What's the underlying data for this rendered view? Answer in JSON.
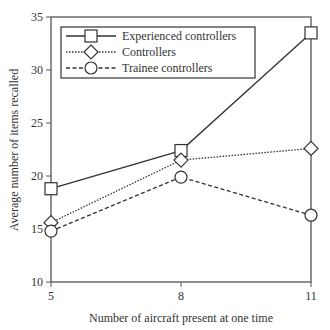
{
  "chart_data": {
    "type": "line",
    "title": "",
    "xlabel": "Number of aircraft present at one time",
    "ylabel": "Average number of items recalled",
    "x": [
      5,
      8,
      11
    ],
    "x_tick_labels": [
      "5",
      "8",
      "11"
    ],
    "y_ticks": [
      10,
      15,
      20,
      25,
      30,
      35
    ],
    "y_tick_labels": [
      "10",
      "15",
      "20",
      "25",
      "30",
      "35"
    ],
    "xlim": [
      5,
      11
    ],
    "ylim": [
      10,
      35
    ],
    "grid": false,
    "legend_position": "upper left",
    "series": [
      {
        "name": "Experienced controllers",
        "values": [
          18.8,
          22.4,
          33.5
        ],
        "marker": "square",
        "line_style": "solid"
      },
      {
        "name": "Controllers",
        "values": [
          15.6,
          21.5,
          22.6
        ],
        "marker": "diamond",
        "line_style": "dotted"
      },
      {
        "name": "Trainee controllers",
        "values": [
          14.8,
          19.9,
          16.3
        ],
        "marker": "circle",
        "line_style": "dashed"
      }
    ]
  },
  "colors": {
    "line": "#333333",
    "axis": "#555555",
    "background": "#ffffff"
  }
}
